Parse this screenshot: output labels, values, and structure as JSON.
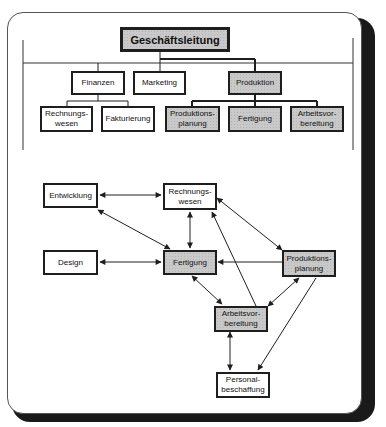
{
  "org_chart": {
    "root": {
      "label": "Geschäftsleitung",
      "shaded": true
    },
    "level1": [
      {
        "label": "Finanzen",
        "shaded": false
      },
      {
        "label": "Marketing",
        "shaded": false
      },
      {
        "label": "Produktion",
        "shaded": true
      }
    ],
    "level2": [
      {
        "label": "Rechnungs-\nwesen",
        "parent": "Finanzen",
        "shaded": false
      },
      {
        "label": "Fakturierung",
        "parent": "Finanzen",
        "shaded": false
      },
      {
        "label": "Produktions-\nplanung",
        "parent": "Produktion",
        "shaded": true
      },
      {
        "label": "Fertigung",
        "parent": "Produktion",
        "shaded": true
      },
      {
        "label": "Arbeitsvor-\nbereitung",
        "parent": "Produktion",
        "shaded": true
      }
    ]
  },
  "network": {
    "nodes": {
      "entwicklung": {
        "label": "Entwicklung",
        "shaded": false
      },
      "rechnungswesen": {
        "label": "Rechnungs-\nwesen",
        "shaded": false
      },
      "design": {
        "label": "Design",
        "shaded": false
      },
      "fertigung": {
        "label": "Fertigung",
        "shaded": true
      },
      "produktionsplanung": {
        "label": "Produktions-\nplanung",
        "shaded": true
      },
      "arbeitsvorbereitung": {
        "label": "Arbeitsvor-\nbereitung",
        "shaded": true
      },
      "personalbeschaffung": {
        "label": "Personal-\nbeschaffung",
        "shaded": false
      }
    },
    "edges": [
      {
        "from": "entwicklung",
        "to": "rechnungswesen",
        "type": "bidirectional"
      },
      {
        "from": "entwicklung",
        "to": "fertigung",
        "type": "bidirectional"
      },
      {
        "from": "rechnungswesen",
        "to": "fertigung",
        "type": "bidirectional"
      },
      {
        "from": "rechnungswesen",
        "to": "produktionsplanung",
        "type": "bidirectional"
      },
      {
        "from": "arbeitsvorbereitung",
        "to": "rechnungswesen",
        "type": "directed"
      },
      {
        "from": "design",
        "to": "fertigung",
        "type": "bidirectional"
      },
      {
        "from": "produktionsplanung",
        "to": "fertigung",
        "type": "directed"
      },
      {
        "from": "fertigung",
        "to": "arbeitsvorbereitung",
        "type": "bidirectional"
      },
      {
        "from": "produktionsplanung",
        "to": "arbeitsvorbereitung",
        "type": "bidirectional"
      },
      {
        "from": "arbeitsvorbereitung",
        "to": "personalbeschaffung",
        "type": "bidirectional"
      },
      {
        "from": "produktionsplanung",
        "to": "personalbeschaffung",
        "type": "directed"
      }
    ]
  },
  "colors": {
    "line": "#1e1e1e",
    "shaded_fill": "#c9c9c9",
    "frame_shadow": "#1a1a1a"
  }
}
